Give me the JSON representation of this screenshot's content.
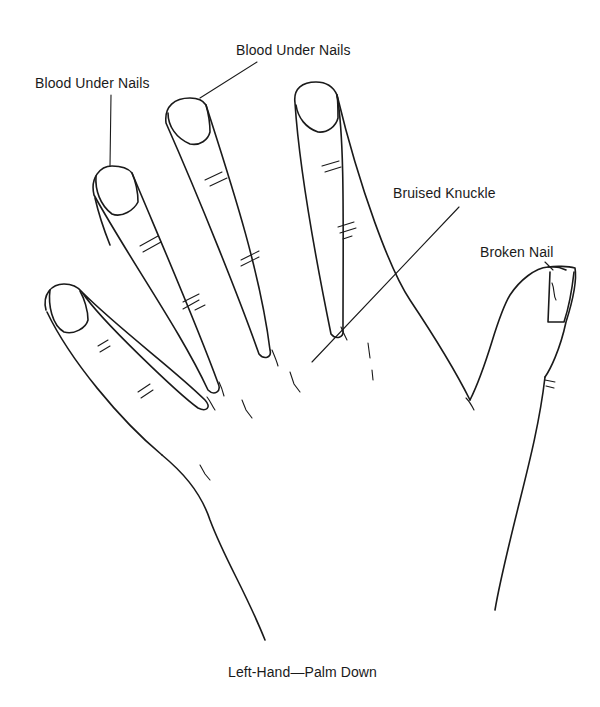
{
  "figure": {
    "caption": "Left-Hand—Palm Down",
    "background": "#ffffff",
    "ink_color": "#1a1a1a"
  },
  "annotations": [
    {
      "id": "ring-nail",
      "label": "Blood Under Nails",
      "target": "ring finger nail"
    },
    {
      "id": "middle-nail",
      "label": "Blood Under Nails",
      "target": "middle finger nail"
    },
    {
      "id": "knuckle",
      "label": "Bruised Knuckle",
      "target": "index finger knuckle"
    },
    {
      "id": "thumb-nail",
      "label": "Broken Nail",
      "target": "thumb nail"
    }
  ]
}
